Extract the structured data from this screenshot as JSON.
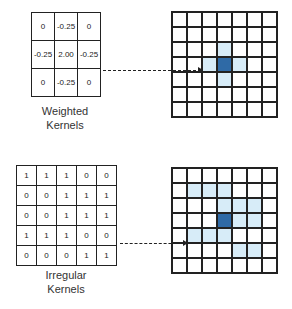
{
  "colors": {
    "highlight": "#d7ecf8",
    "center": "#2f6aa6",
    "line": "#222222"
  },
  "weighted": {
    "label1": "Weighted",
    "label2": "Kernels",
    "rows": [
      [
        "0",
        "-0.25",
        "0"
      ],
      [
        "-0.25",
        "2.00",
        "-0.25"
      ],
      [
        "0",
        "-0.25",
        "0"
      ]
    ],
    "output": {
      "size": 7,
      "center": [
        3,
        3
      ],
      "highlight": [
        [
          2,
          3
        ],
        [
          3,
          2
        ],
        [
          3,
          4
        ],
        [
          4,
          3
        ]
      ]
    }
  },
  "irregular": {
    "label1": "Irregular",
    "label2": "Kernels",
    "rows": [
      [
        "1",
        "1",
        "1",
        "0",
        "0"
      ],
      [
        "0",
        "0",
        "1",
        "1",
        "1"
      ],
      [
        "0",
        "0",
        "1",
        "1",
        "1"
      ],
      [
        "1",
        "1",
        "1",
        "0",
        "0"
      ],
      [
        "0",
        "0",
        "0",
        "1",
        "1"
      ]
    ],
    "output": {
      "size": 7,
      "center": [
        3,
        3
      ],
      "highlight": [
        [
          1,
          1
        ],
        [
          1,
          2
        ],
        [
          1,
          3
        ],
        [
          2,
          3
        ],
        [
          2,
          4
        ],
        [
          2,
          5
        ],
        [
          3,
          4
        ],
        [
          3,
          5
        ],
        [
          4,
          1
        ],
        [
          4,
          2
        ],
        [
          4,
          3
        ],
        [
          5,
          4
        ],
        [
          5,
          5
        ]
      ]
    }
  }
}
